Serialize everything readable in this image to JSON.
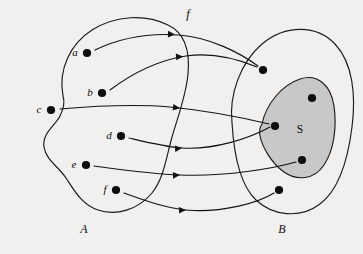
{
  "figure": {
    "kind": "function-mapping-diagram",
    "background_color": "#f2f0ee",
    "ink_color": "#121212",
    "subset_fill_color": "#c8c8c8"
  },
  "function": {
    "name": "f",
    "label_x": 188,
    "label_y": 18
  },
  "domain_set": {
    "label": "A",
    "label_x": 84,
    "label_y": 233,
    "outline": "M 63 96 C 58 70 70 44 92 30 C 116 15 146 14 168 25 C 185 33 190 52 188 74 C 186 96 178 116 172 137 C 166 158 164 178 152 193 C 138 210 116 216 98 210 C 82 205 74 190 66 178 C 58 166 46 160 44 147 C 42 133 55 126 60 116 C 64 108 65 102 63 96 Z",
    "elements": [
      {
        "id": "a",
        "label": "a",
        "dot_x": 87,
        "dot_y": 53,
        "label_x": 75,
        "label_y": 56
      },
      {
        "id": "b",
        "label": "b",
        "dot_x": 102,
        "dot_y": 93,
        "label_x": 90,
        "label_y": 96
      },
      {
        "id": "c",
        "label": "c",
        "dot_x": 51,
        "dot_y": 110,
        "label_x": 39,
        "label_y": 113
      },
      {
        "id": "d",
        "label": "d",
        "dot_x": 121,
        "dot_y": 136,
        "label_x": 109,
        "label_y": 139
      },
      {
        "id": "e",
        "label": "e",
        "dot_x": 86,
        "dot_y": 165,
        "label_x": 74,
        "label_y": 168
      },
      {
        "id": "f",
        "label": "f",
        "dot_x": 116,
        "dot_y": 190,
        "label_x": 105,
        "label_y": 193
      }
    ]
  },
  "codomain_set": {
    "label": "B",
    "label_x": 282,
    "label_y": 233,
    "outline": "M 232 123 C 229 95 240 63 262 44 C 286 24 317 25 335 44 C 353 63 356 96 352 127 C 348 159 340 189 320 204 C 300 219 273 216 256 200 C 240 185 234 156 232 123 Z",
    "elements": [
      {
        "id": "b1",
        "dot_x": 263,
        "dot_y": 70,
        "in_subset": false
      },
      {
        "id": "b2",
        "dot_x": 275,
        "dot_y": 126,
        "in_subset": true
      },
      {
        "id": "b3",
        "dot_x": 312,
        "dot_y": 98,
        "in_subset": true
      },
      {
        "id": "b4",
        "dot_x": 302,
        "dot_y": 160,
        "in_subset": true
      },
      {
        "id": "b5",
        "dot_x": 279,
        "dot_y": 190,
        "in_subset": false
      }
    ]
  },
  "subset": {
    "label": "S",
    "label_x": 300,
    "label_y": 133,
    "outline": "M 262 124 C 266 104 282 85 300 79 C 318 73 331 86 334 106 C 337 127 334 150 324 165 C 314 180 297 181 284 172 C 271 163 262 146 260 136 C 259 131 260 127 262 124 Z"
  },
  "arrows": [
    {
      "from": "a",
      "to": "b1",
      "path": "M 95 50 C 120 38 150 33 178 35 C 210 37 240 53 258 66",
      "head_x": 175,
      "head_y": 34.4,
      "head_angle": 2
    },
    {
      "from": "b",
      "to": "b1",
      "path": "M 110 90 C 134 72 160 60 186 56 C 214 52 240 60 257 67",
      "head_x": 183,
      "head_y": 56.4,
      "head_angle": -4
    },
    {
      "from": "c",
      "to": "b2",
      "path": "M 60 109 C 95 106 135 104 170 107 C 212 111 248 119 269 124",
      "head_x": 180,
      "head_y": 108.2,
      "head_angle": 7
    },
    {
      "from": "d",
      "to": "b2",
      "path": "M 129 138 C 150 143 166 147 182 148 C 215 150 250 138 270 127",
      "head_x": 182,
      "head_y": 148.1,
      "head_angle": -5
    },
    {
      "from": "e",
      "to": "b4",
      "path": "M 94 166 C 124 170 152 174 180 175 C 226 177 275 168 296 162",
      "head_x": 180,
      "head_y": 175.1,
      "head_angle": -2
    },
    {
      "from": "f",
      "to": "b5",
      "path": "M 124 193 C 146 201 166 208 186 210 C 222 213 258 203 274 193",
      "head_x": 186,
      "head_y": 209.9,
      "head_angle": -3
    }
  ]
}
